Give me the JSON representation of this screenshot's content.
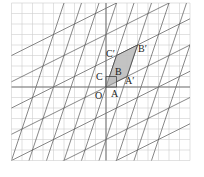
{
  "diagram": {
    "type": "linear-transformation-grid",
    "grid": {
      "x_min": -9,
      "x_max": 8,
      "y_min": -7,
      "y_max": 8,
      "unit_px": 10.5
    },
    "origin_px": [
      106,
      87
    ],
    "colors": {
      "grid": "#cfcfcf",
      "axes": "#777777",
      "lines": "#555555",
      "fill": "#bdbdbd",
      "outline": "#444444"
    },
    "basis_images": {
      "A_prime": [
        2,
        1
      ],
      "C_prime": [
        1,
        3
      ]
    },
    "points": {
      "O": {
        "label": "O",
        "coords": [
          0,
          0
        ]
      },
      "A": {
        "label": "A",
        "coords": [
          1,
          0
        ]
      },
      "B": {
        "label": "B",
        "coords": [
          1,
          1
        ]
      },
      "C": {
        "label": "C",
        "coords": [
          0,
          1
        ]
      },
      "A_prime": {
        "label": "A′",
        "coords": [
          2,
          1
        ]
      },
      "B_prime": {
        "label": "B′",
        "coords": [
          3,
          4
        ]
      },
      "C_prime": {
        "label": "C′",
        "coords": [
          1,
          3
        ]
      }
    }
  }
}
